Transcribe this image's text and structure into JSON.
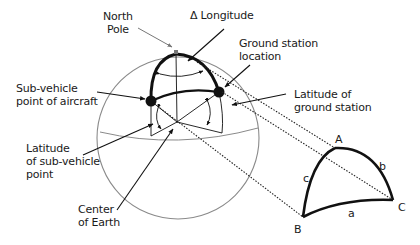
{
  "diagram": {
    "labels": {
      "north_pole": "North\nPole",
      "delta_longitude": "Δ Longitude",
      "ground_station_location": "Ground station\nlocation",
      "sub_vehicle_point": "Sub-vehicle\npoint of aircraft",
      "latitude_ground_station": "Latitude of\nground station",
      "latitude_sub_vehicle": "Latitude\nof sub-vehicle\npoint",
      "center_of_earth": "Center\nof Earth"
    },
    "triangle": {
      "vertices": {
        "A": "A",
        "B": "B",
        "C": "C"
      },
      "sides": {
        "a": "a",
        "b": "b",
        "c": "c"
      }
    },
    "colors": {
      "sphere_outline": "#8a8a8a",
      "ink": "#111111",
      "background": "#ffffff"
    }
  }
}
